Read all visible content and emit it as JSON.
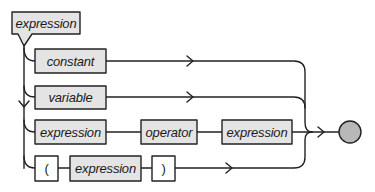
{
  "diagram": {
    "type": "syntax-diagram",
    "colors": {
      "line": "#222222",
      "box_fill": "#e4e4e4",
      "terminal_fill": "#ffffff",
      "end_circle_fill": "#b8b8b8"
    },
    "start": {
      "label": "expression"
    },
    "rows": [
      {
        "items": [
          {
            "label": "constant",
            "kind": "nonterminal"
          }
        ]
      },
      {
        "items": [
          {
            "label": "variable",
            "kind": "nonterminal"
          }
        ]
      },
      {
        "items": [
          {
            "label": "expression",
            "kind": "nonterminal"
          },
          {
            "label": "operator",
            "kind": "nonterminal"
          },
          {
            "label": "expression",
            "kind": "nonterminal"
          }
        ]
      },
      {
        "items": [
          {
            "label": "(",
            "kind": "terminal"
          },
          {
            "label": "expression",
            "kind": "nonterminal"
          },
          {
            "label": ")",
            "kind": "terminal"
          }
        ]
      }
    ],
    "end": {
      "shape": "circle"
    }
  }
}
